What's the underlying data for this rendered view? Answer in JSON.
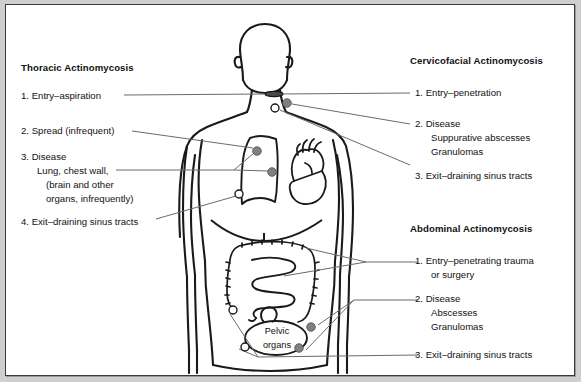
{
  "figure": {
    "title_alt": "Forms of actinomycosis: anatomic sites, entry, disease and exit",
    "background_color": "#cfcfcf",
    "panel_color": "#ffffff",
    "border_color": "#3a3a3a",
    "ink_color": "#111111",
    "marker_filled_color": "#808080",
    "marker_open_color": "#ffffff",
    "leader_color": "#6b6b6b"
  },
  "blocks": {
    "thoracic": {
      "heading": "Thoracic Actinomycosis",
      "items": [
        {
          "num": "1.",
          "lines": [
            "Entry–aspiration"
          ]
        },
        {
          "num": "2.",
          "lines": [
            "Spread (infrequent)"
          ]
        },
        {
          "num": "3.",
          "lines": [
            "Disease",
            "Lung, chest wall,",
            "(brain and other",
            "organs, infrequently)"
          ]
        },
        {
          "num": "4.",
          "lines": [
            "Exit–draining sinus tracts"
          ]
        }
      ]
    },
    "cervicofacial": {
      "heading": "Cervicofacial Actinomycosis",
      "items": [
        {
          "num": "1.",
          "lines": [
            "Entry–penetration"
          ]
        },
        {
          "num": "2.",
          "lines": [
            "Disease",
            "Suppurative abscesses",
            "Granulomas"
          ]
        },
        {
          "num": "3.",
          "lines": [
            "Exit–draining sinus tracts"
          ]
        }
      ]
    },
    "abdominal": {
      "heading": "Abdominal Actinomycosis",
      "items": [
        {
          "num": "1.",
          "lines": [
            "Entry–penetrating trauma",
            "or surgery"
          ]
        },
        {
          "num": "2.",
          "lines": [
            "Disease",
            "Abscesses",
            "Granulomas"
          ]
        },
        {
          "num": "3.",
          "lines": [
            "Exit–draining sinus tracts"
          ]
        }
      ]
    }
  },
  "text_runs": {
    "thoracic_heading": "Thoracic Actinomycosis",
    "thoracic_1": "1. Entry–aspiration",
    "thoracic_2": "2. Spread (infrequent)",
    "thoracic_3a": "3. Disease",
    "thoracic_3b": "Lung, chest wall,",
    "thoracic_3c": "(brain and other",
    "thoracic_3d": "organs, infrequently)",
    "thoracic_4": "4. Exit–draining sinus tracts",
    "cervico_heading": "Cervicofacial Actinomycosis",
    "cervico_1": "1. Entry–penetration",
    "cervico_2a": "2. Disease",
    "cervico_2b": "Suppurative abscesses",
    "cervico_2c": "Granulomas",
    "cervico_3": "3. Exit–draining sinus tracts",
    "abdominal_heading": "Abdominal Actinomycosis",
    "abdominal_1a": "1. Entry–penetrating trauma",
    "abdominal_1b": "or surgery",
    "abdominal_2a": "2. Disease",
    "abdominal_2b": "Abscesses",
    "abdominal_2c": "Granulomas",
    "abdominal_3": "3. Exit–draining sinus tracts",
    "organ_pelvic_1": "Pelvic",
    "organ_pelvic_2": "organs"
  },
  "markers": {
    "legend": {
      "filled": "disease-site-marker",
      "open": "sinus-tract-exit-marker",
      "oval": "entry-site-marker"
    },
    "neck": [
      {
        "name": "entry-oval-neck",
        "type": "oval",
        "x": 268,
        "y": 89
      },
      {
        "name": "disease-dot-neck",
        "type": "filled",
        "x": 281,
        "y": 98
      },
      {
        "name": "exit-circle-neck",
        "type": "open",
        "x": 269,
        "y": 103
      }
    ],
    "thorax": [
      {
        "name": "disease-dot-chest-wall",
        "type": "filled",
        "x": 251,
        "y": 146
      },
      {
        "name": "disease-dot-lung",
        "type": "filled",
        "x": 266,
        "y": 167
      },
      {
        "name": "exit-circle-chest",
        "type": "open",
        "x": 233,
        "y": 189
      }
    ],
    "abdomen": [
      {
        "name": "exit-circle-abdomen-upper",
        "type": "open",
        "x": 227,
        "y": 305
      },
      {
        "name": "exit-circle-abdomen-lower",
        "type": "open",
        "x": 239,
        "y": 342
      },
      {
        "name": "disease-dot-pelvis-right",
        "type": "filled",
        "x": 305,
        "y": 322
      },
      {
        "name": "disease-dot-pelvis-lower",
        "type": "filled",
        "x": 293,
        "y": 343
      }
    ]
  }
}
